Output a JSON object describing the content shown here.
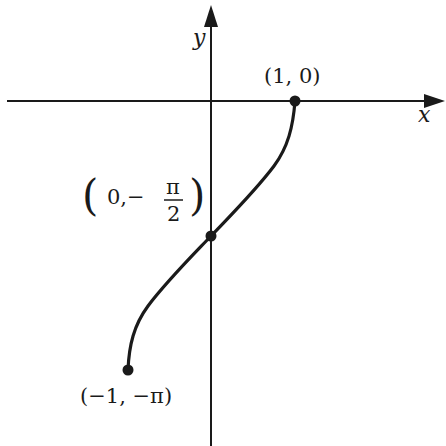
{
  "figure": {
    "function": "y = -arccos(x)",
    "axes": {
      "x_label": "x",
      "y_label": "y"
    },
    "points": [
      {
        "label": "(1, 0)",
        "x": 1,
        "y": 0
      },
      {
        "label_open": "(",
        "label_inner": "0,−",
        "frac_num": "π",
        "frac_den": "2",
        "label_close": ")",
        "x": 0,
        "y": "-π/2"
      },
      {
        "label": "(−1, −π)",
        "x": -1,
        "y": "-π"
      }
    ],
    "colors": {
      "ink": "#1a1a1a",
      "background": "#ffffff"
    }
  }
}
